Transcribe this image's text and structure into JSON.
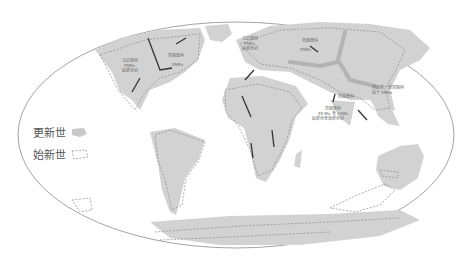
{
  "map": {
    "projection": "mollweide-like world map",
    "legend": [
      {
        "label": "更新世",
        "style": "filled-gray",
        "color": "#c8c8c8"
      },
      {
        "label": "始新世",
        "style": "dashed-outline",
        "color": "#8a8a8a"
      }
    ],
    "annotations": [
      {
        "id": "na-west",
        "lines": [
          "马齿兽科",
          "55Ma",
          "始新世初"
        ]
      },
      {
        "id": "na-east",
        "lines": [
          "奇蹄兽科",
          "55Ma"
        ]
      },
      {
        "id": "europe",
        "lines": [
          "马齿兽科",
          "55Ma",
          "始新世初"
        ]
      },
      {
        "id": "asia-north",
        "lines": [
          "奇蹄兽科",
          "55Ma"
        ]
      },
      {
        "id": "asia-east",
        "lines": [
          "奇蹄类一新奇蹄科",
          "始于 55Ma"
        ]
      },
      {
        "id": "india",
        "lines": [
          "奇蹄兽科"
        ]
      },
      {
        "id": "south-asia",
        "lines": [
          "奇蹄兽科",
          "55 Ma 至 34Ma",
          "始新世至渐新世初"
        ]
      }
    ]
  }
}
